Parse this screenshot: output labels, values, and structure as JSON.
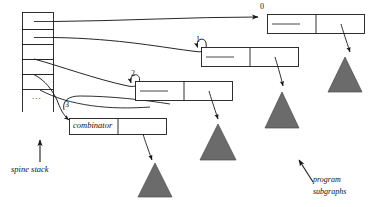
{
  "figure": {
    "type": "graph-reduction-diagram",
    "colors": {
      "stroke": "#1a1a1a",
      "triangle_fill": "#6b6b6b",
      "triangle_stroke": "#4a4a4a",
      "background": "#ffffff"
    }
  },
  "spine_stack": {
    "label": "spine stack",
    "ellipsis": "...",
    "cell_count": 5,
    "cells": [
      {
        "index": 0,
        "points_to": "0"
      },
      {
        "index": 1,
        "points_to": "1"
      },
      {
        "index": 2,
        "points_to": "2"
      },
      {
        "index": 3,
        "points_to": "3"
      },
      {
        "index": 4,
        "points_to": "combinator"
      }
    ]
  },
  "nodes": [
    {
      "id": "0",
      "label": "0",
      "left_cell": "",
      "right_cell": "",
      "cells": 2
    },
    {
      "id": "1",
      "label": "1",
      "left_cell": "",
      "right_cell": "",
      "cells": 2
    },
    {
      "id": "2",
      "label": "2",
      "left_cell": "",
      "right_cell": "",
      "cells": 2
    },
    {
      "id": "3",
      "label": "3",
      "left_cell": "combinator",
      "right_cell": "",
      "cells": 2
    }
  ],
  "combinator": {
    "label": "combinator"
  },
  "subgraphs": {
    "label_line1": "program",
    "label_line2": "subgraphs",
    "count": 4
  }
}
